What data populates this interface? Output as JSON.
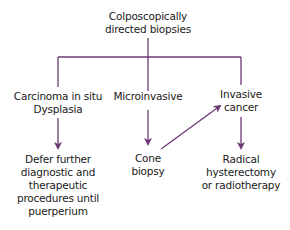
{
  "diagram": {
    "line_color": "#6b3a73",
    "root": {
      "line1": "Colposcopically",
      "line2": "directed biopsies"
    },
    "branches": [
      {
        "line1": "Carcinoma in situ",
        "line2": "Dysplasia"
      },
      {
        "line1": "Microinvasive"
      },
      {
        "line1": "Invasive",
        "line2": "cancer"
      }
    ],
    "outcomes": [
      {
        "lines": [
          "Defer further",
          "diagnostic and",
          "therapeutic",
          "procedures until",
          "puerperium"
        ]
      },
      {
        "lines": [
          "Cone",
          "biopsy"
        ]
      },
      {
        "lines": [
          "Radical",
          "hysterectomy",
          "or radiotherapy"
        ]
      }
    ]
  }
}
